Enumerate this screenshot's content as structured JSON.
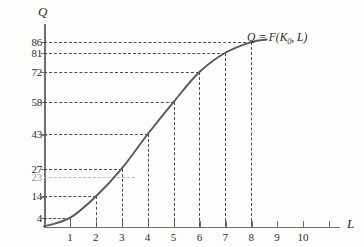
{
  "chart_data": {
    "type": "line",
    "title": "",
    "xlabel": "L",
    "ylabel": "Q",
    "xlim": [
      0,
      11.4
    ],
    "ylim": [
      0,
      93
    ],
    "grid": false,
    "legend_position": "none",
    "x": [
      1,
      2,
      3,
      4,
      5,
      6,
      7,
      8
    ],
    "values": [
      4,
      14,
      27,
      43,
      58,
      72,
      81,
      86
    ],
    "series": [
      {
        "name": "Q = F(K0, L)",
        "x": [
          1,
          2,
          3,
          4,
          5,
          6,
          7,
          8
        ],
        "values": [
          4,
          14,
          27,
          43,
          58,
          72,
          81,
          86
        ]
      }
    ],
    "annotations": [
      {
        "name": "curve-label",
        "text_prefix": "Q = F(K",
        "text_subscript": "0",
        "text_suffix": ", L)"
      }
    ],
    "xticks": [
      {
        "value": 1,
        "label": "1",
        "dashed_guide": true
      },
      {
        "value": 2,
        "label": "2",
        "dashed_guide": true
      },
      {
        "value": 3,
        "label": "3",
        "dashed_guide": true
      },
      {
        "value": 4,
        "label": "4",
        "dashed_guide": true
      },
      {
        "value": 5,
        "label": "5",
        "dashed_guide": true
      },
      {
        "value": 6,
        "label": "6",
        "dashed_guide": true
      },
      {
        "value": 7,
        "label": "7",
        "dashed_guide": true
      },
      {
        "value": 8,
        "label": "8",
        "dashed_guide": true
      },
      {
        "value": 9,
        "label": "9",
        "dashed_guide": false
      },
      {
        "value": 10,
        "label": "10",
        "dashed_guide": false
      },
      {
        "value": 11,
        "label": "",
        "dashed_guide": false
      }
    ],
    "yticks": [
      {
        "value": 86,
        "label": "86",
        "faint": false
      },
      {
        "value": 81,
        "label": "81",
        "faint": false
      },
      {
        "value": 72,
        "label": "72",
        "faint": false
      },
      {
        "value": 58,
        "label": "58",
        "faint": false
      },
      {
        "value": 43,
        "label": "43",
        "faint": false
      },
      {
        "value": 27,
        "label": "27",
        "faint": false
      },
      {
        "value": 23,
        "label": "23",
        "faint": true
      },
      {
        "value": 14,
        "label": "14",
        "faint": false
      },
      {
        "value": 4,
        "label": "4",
        "faint": false
      }
    ],
    "colors": {
      "curve": "#595959",
      "axis": "#6f6f6f",
      "guide": "#4c4c4c",
      "text": "#2c2c2c",
      "background": "#fdfdfc"
    }
  }
}
